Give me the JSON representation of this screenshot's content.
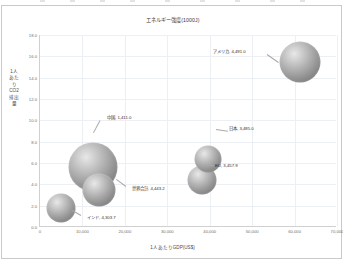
{
  "chart": {
    "title": "エネルギー強度(1000J)",
    "x_axis_title": "1人あたりGDP(US$)",
    "y_axis_title": "1人あたりCO2排出量"
  },
  "chart_data": {
    "type": "scatter",
    "title": "エネルギー強度(1000J)",
    "xlabel": "1人あたりGDP(US$)",
    "ylabel": "1人あたりCO2排出量",
    "xlim": [
      0,
      70000
    ],
    "ylim": [
      0,
      18
    ],
    "xticks": [
      "0",
      "10,000",
      "20,000",
      "30,000",
      "40,000",
      "50,000",
      "60,000",
      "70,000"
    ],
    "xtick_values": [
      0,
      10000,
      20000,
      30000,
      40000,
      50000,
      60000,
      70000
    ],
    "yticks": [
      "0.0",
      "2.0",
      "4.0",
      "6.0",
      "8.0",
      "10.0",
      "12.0",
      "14.0",
      "16.0",
      "18.0"
    ],
    "ytick_values": [
      0,
      2,
      4,
      6,
      8,
      10,
      12,
      14,
      16,
      18
    ],
    "grid": true,
    "legend": "none",
    "size_meaning": "エネルギー強度(1000J)",
    "points": [
      {
        "name": "アメリカ",
        "value": "4,491.0",
        "label": "アメリカ, 4,491.0",
        "x": 61500,
        "y": 15.5,
        "size": 4491.0,
        "r_px": 20.5,
        "label_x": 211,
        "label_y": 45,
        "leader_x": 265,
        "leader_y": 48,
        "leader_len": 14,
        "leader_angle": 35
      },
      {
        "name": "中国",
        "value": "1,411.0",
        "label": "中国, 1,411.0",
        "x": 12800,
        "y": 5.6,
        "size": 1411.0,
        "r_px": 24.5,
        "label_x": 105,
        "label_y": 111,
        "leader_x": 98,
        "leader_y": 114,
        "leader_len": 14,
        "leader_angle": 118
      },
      {
        "name": "世界合計",
        "value": "4,443.2",
        "label": "世界合計, 4,443.2",
        "x": 14200,
        "y": 3.5,
        "size": 4443.2,
        "r_px": 16.5,
        "label_x": 130,
        "label_y": 182,
        "leader_x": 124,
        "leader_y": 180,
        "leader_len": 12,
        "leader_angle": 216
      },
      {
        "name": "インド",
        "value": "4,303.7",
        "label": "インド, 4,303.7",
        "x": 5200,
        "y": 1.8,
        "size": 4303.7,
        "r_px": 14.5,
        "label_x": 85,
        "label_y": 211,
        "leader_x": 79,
        "leader_y": 209,
        "leader_len": 10,
        "leader_angle": 210
      },
      {
        "name": "日本",
        "value": "3,485.0",
        "label": "日本, 3,485.0",
        "x": 39800,
        "y": 6.4,
        "size": 3485.0,
        "r_px": 13.5,
        "label_x": 227,
        "label_y": 122,
        "leader_x": 214,
        "leader_y": 123,
        "leader_len": 12,
        "leader_angle": 8
      },
      {
        "name": "EU",
        "value": "3,457.9",
        "label": "EU, 3,457.9",
        "x": 38300,
        "y": 4.4,
        "size": 3457.9,
        "r_px": 14.5,
        "label_x": 213,
        "label_y": 159,
        "leader_x": 202,
        "leader_y": 158,
        "leader_len": 10,
        "leader_angle": 8
      }
    ]
  }
}
